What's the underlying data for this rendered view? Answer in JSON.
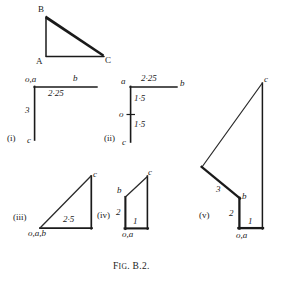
{
  "figure": {
    "caption_prefix": "F",
    "caption_small": "IG",
    "caption_rest": ". B.2."
  },
  "mechanism": {
    "label_b": "B",
    "label_a": "A",
    "label_c": "C"
  },
  "diagram_i": {
    "tag": "(i)",
    "node_oa": "o,a",
    "node_b": "b",
    "node_c": "c",
    "len_ab": "2·25",
    "len_oc": "3"
  },
  "diagram_ii": {
    "tag": "(ii)",
    "node_a": "a",
    "node_b": "b",
    "node_o": "o",
    "node_c": "c",
    "len_ab": "2·25",
    "len_ao": "1·5",
    "len_oc": "1·5"
  },
  "diagram_iii": {
    "tag": "(iii)",
    "node_c": "c",
    "node_oab": "o,a,b",
    "len_hyp": "2·5"
  },
  "diagram_iv": {
    "tag": "(iv)",
    "node_c": "c",
    "node_b": "b",
    "node_oa": "o,a",
    "len_left": "2",
    "len_bottom": "1"
  },
  "diagram_v": {
    "tag": "(v)",
    "node_c": "c",
    "node_b": "b",
    "node_oa": "o,a",
    "len_3": "3",
    "len_2": "2",
    "len_1": "1"
  },
  "colors": {
    "ink": "#1a1a1a",
    "thin": "#333333",
    "paper": "#ffffff"
  }
}
